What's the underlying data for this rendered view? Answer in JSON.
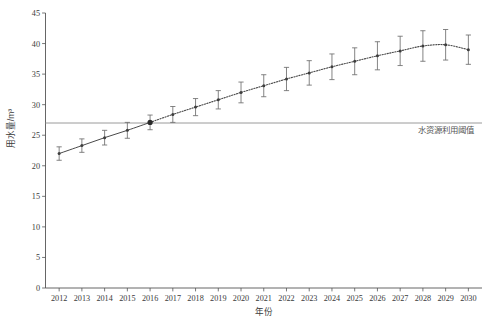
{
  "chart_data": {
    "type": "line",
    "title": "",
    "xlabel": "年份",
    "ylabel": "用水量/m³",
    "xlim": [
      2011.4,
      2030.6
    ],
    "ylim": [
      0,
      45
    ],
    "yticks": [
      0,
      5,
      10,
      15,
      20,
      25,
      30,
      35,
      40,
      45
    ],
    "grid": false,
    "legend": null,
    "categories": [
      "2012",
      "2013",
      "2014",
      "2015",
      "2016",
      "2017",
      "2018",
      "2019",
      "2020",
      "2021",
      "2022",
      "2023",
      "2024",
      "2025",
      "2026",
      "2027",
      "2028",
      "2029",
      "2030"
    ],
    "x": [
      2012,
      2013,
      2014,
      2015,
      2016,
      2017,
      2018,
      2019,
      2020,
      2021,
      2022,
      2023,
      2024,
      2025,
      2026,
      2027,
      2028,
      2029,
      2030
    ],
    "values": [
      22.0,
      23.3,
      24.6,
      25.8,
      27.1,
      28.4,
      29.6,
      30.8,
      32.0,
      33.1,
      34.2,
      35.2,
      36.2,
      37.1,
      38.0,
      38.8,
      39.6,
      39.8,
      39.0
    ],
    "errors": [
      1.1,
      1.1,
      1.2,
      1.3,
      1.2,
      1.3,
      1.4,
      1.5,
      1.7,
      1.8,
      1.9,
      2.0,
      2.1,
      2.2,
      2.3,
      2.4,
      2.5,
      2.5,
      2.4
    ],
    "series": [
      {
        "name": "用水量",
        "values": [
          22.0,
          23.3,
          24.6,
          25.8,
          27.1,
          28.4,
          29.6,
          30.8,
          32.0,
          33.1,
          34.2,
          35.2,
          36.2,
          37.1,
          38.0,
          38.8,
          39.6,
          39.8,
          39.0
        ],
        "errors": [
          1.1,
          1.1,
          1.2,
          1.3,
          1.2,
          1.3,
          1.4,
          1.5,
          1.7,
          1.8,
          1.9,
          2.0,
          2.1,
          2.2,
          2.3,
          2.4,
          2.5,
          2.5,
          2.4
        ],
        "solid_until_x": 2016,
        "style_solid": "solid",
        "style_forecast": "dotted"
      }
    ],
    "threshold": {
      "value": 27.0,
      "label": "水资源利用阈值",
      "color": "#9a9a9a"
    },
    "highlight_point": {
      "x": 2016,
      "y": 27.1
    },
    "annotations": [
      {
        "text": "水资源利用阈值",
        "x": 2029.0,
        "y": 25.3
      }
    ],
    "colors": {
      "series": "#4a4a4a",
      "error_bar": "#6e6e6e",
      "threshold": "#9a9a9a",
      "axis": "#555555",
      "text": "#3a3a3a"
    }
  },
  "caption": {
    "text": ""
  }
}
